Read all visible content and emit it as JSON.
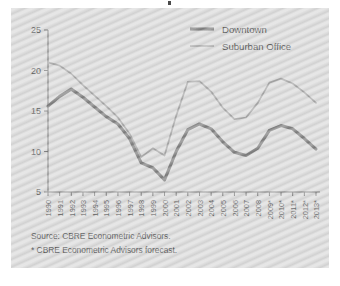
{
  "panel": {
    "background_color": "#d9d9d9",
    "page_background": "#ffffff"
  },
  "legend": {
    "position": "top-right",
    "items": [
      {
        "label": "Downtown",
        "color": "#707070",
        "width": "thick"
      },
      {
        "label": "Suburban Office",
        "color": "#9d9d9d",
        "width": "thin"
      }
    ]
  },
  "notes": {
    "source": "Source: CBRE Econometric Advisors.",
    "forecast": "* CBRE Econometric Advisors forecast."
  },
  "chart_data": {
    "type": "line",
    "title": "",
    "xlabel": "",
    "ylabel": "",
    "ylim": [
      5,
      25
    ],
    "yticks": [
      5,
      10,
      15,
      20,
      25
    ],
    "grid": false,
    "legend_position": "top-right",
    "categories": [
      "1990",
      "1991",
      "1992",
      "1993",
      "1994",
      "1995",
      "1996",
      "1997",
      "1998",
      "1999",
      "2000",
      "2001",
      "2002",
      "2003",
      "2004",
      "2005",
      "2006",
      "2007",
      "2008",
      "2009*",
      "2010*",
      "2011*",
      "2012*",
      "2013*"
    ],
    "series": [
      {
        "name": "Downtown",
        "color": "#707070",
        "values": [
          15.6,
          16.8,
          17.7,
          16.7,
          15.5,
          14.3,
          13.4,
          11.6,
          8.6,
          8.0,
          6.5,
          10.0,
          12.7,
          13.4,
          12.8,
          11.2,
          9.9,
          9.5,
          10.4,
          12.6,
          13.2,
          12.8,
          11.6,
          10.3
        ]
      },
      {
        "name": "Suburban Office",
        "color": "#9d9d9d",
        "values": [
          21.0,
          20.6,
          19.6,
          18.2,
          16.9,
          15.6,
          14.2,
          12.2,
          9.3,
          10.4,
          9.5,
          14.4,
          18.6,
          18.7,
          17.4,
          15.4,
          14.0,
          14.2,
          16.0,
          18.5,
          19.0,
          18.4,
          17.3,
          16.0
        ]
      }
    ]
  }
}
